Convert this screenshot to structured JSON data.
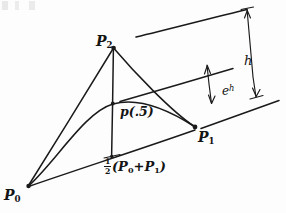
{
  "figure": {
    "ink_color": "#1a1a1a",
    "background_color": "#fdfdfd",
    "labels": {
      "p0": {
        "base": "P",
        "sub": "0"
      },
      "p1": {
        "base": "P",
        "sub": "1"
      },
      "p2": {
        "base": "P",
        "sub": "2"
      },
      "curve_midpoint": "p(.5)",
      "chord_midpoint": {
        "fraction_numerator": "1",
        "fraction_denominator": "2",
        "open_paren": "(",
        "term_one_base": "P",
        "term_one_sub": "0",
        "plus": "+",
        "term_two_base": "P",
        "term_two_sub": "1",
        "close_paren": ")"
      },
      "height_full": "h",
      "height_scaled_base": "e",
      "height_scaled_sup": "h"
    },
    "points": {
      "p0": {
        "x": 28,
        "y": 186
      },
      "p1": {
        "x": 195,
        "y": 127
      },
      "p2": {
        "x": 114,
        "y": 47
      },
      "chord_midpoint": {
        "x": 111,
        "y": 156
      },
      "curve_midpoint": {
        "x": 113,
        "y": 104
      }
    },
    "measurements": [
      {
        "name": "h",
        "description": "full height from chord baseline to apex tangent line"
      },
      {
        "name": "eh",
        "description": "scaled height from chord baseline to curve tangent line"
      }
    ]
  }
}
